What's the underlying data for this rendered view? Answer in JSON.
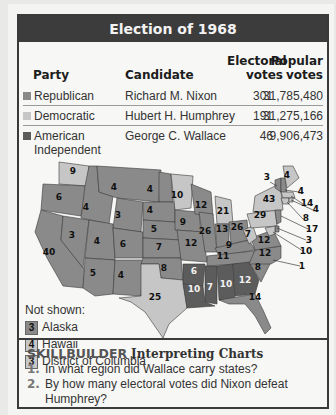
{
  "title": "Election of 1968",
  "table": {
    "headers": {
      "party": "Party",
      "candidate": "Candidate",
      "electoral_line1": "Electoral",
      "electoral_line2": "votes",
      "popular_line1": "Popular",
      "popular_line2": "votes"
    },
    "rows": [
      {
        "party": "Republican",
        "party_line2": "",
        "candidate": "Richard M. Nixon",
        "electoral": "301",
        "popular": "31,785,480",
        "color": "#8a8a8a"
      },
      {
        "party": "Democratic",
        "party_line2": "",
        "candidate": "Hubert H. Humphrey",
        "electoral": "191",
        "popular": "31,275,166",
        "color": "#c6c6c6"
      },
      {
        "party": "American",
        "party_line2": "Independent",
        "candidate": "George C. Wallace",
        "electoral": "46",
        "popular": "9,906,473",
        "color": "#5c5c5c"
      }
    ]
  },
  "not_shown": {
    "label": "Not shown:",
    "items": [
      {
        "votes": "3",
        "state": "Alaska",
        "party": "Republican"
      },
      {
        "votes": "4",
        "state": "Hawaii",
        "party": "Democratic"
      },
      {
        "votes": "3",
        "state": "District of Columbia",
        "party": "Democratic"
      }
    ]
  },
  "skillbuilder": {
    "label": "SKILLBUILDER",
    "subtitle": "Interpreting Charts",
    "questions": [
      {
        "num": "1.",
        "text": "In what region did Wallace carry states?"
      },
      {
        "num": "2.",
        "text": "By how many electoral votes did Nixon defeat Humphrey?"
      }
    ]
  },
  "colors": {
    "republican": "#8a8a8a",
    "democratic": "#c6c6c6",
    "american_independent": "#5c5c5c",
    "header_bg": "#3c3c3c",
    "frame": "#3a3a3a"
  },
  "chart_data": {
    "type": "table",
    "title": "Election of 1968",
    "columns": [
      "Party",
      "Candidate",
      "Electoral votes",
      "Popular votes"
    ],
    "rows": [
      [
        "Republican",
        "Richard M. Nixon",
        301,
        31785480
      ],
      [
        "Democratic",
        "Hubert H. Humphrey",
        191,
        31275166
      ],
      [
        "American Independent",
        "George C. Wallace",
        46,
        9906473
      ]
    ],
    "map": {
      "type": "choropleth",
      "legend": [
        "Republican",
        "Democratic",
        "American Independent"
      ],
      "states": [
        {
          "state": "WA",
          "votes": 9,
          "party": "Democratic"
        },
        {
          "state": "OR",
          "votes": 6,
          "party": "Republican"
        },
        {
          "state": "CA",
          "votes": 40,
          "party": "Republican"
        },
        {
          "state": "ID",
          "votes": 4,
          "party": "Republican"
        },
        {
          "state": "NV",
          "votes": 3,
          "party": "Republican"
        },
        {
          "state": "MT",
          "votes": 4,
          "party": "Republican"
        },
        {
          "state": "WY",
          "votes": 3,
          "party": "Republican"
        },
        {
          "state": "UT",
          "votes": 4,
          "party": "Republican"
        },
        {
          "state": "AZ",
          "votes": 5,
          "party": "Republican"
        },
        {
          "state": "CO",
          "votes": 6,
          "party": "Republican"
        },
        {
          "state": "NM",
          "votes": 4,
          "party": "Republican"
        },
        {
          "state": "ND",
          "votes": 4,
          "party": "Republican"
        },
        {
          "state": "SD",
          "votes": 4,
          "party": "Republican"
        },
        {
          "state": "NE",
          "votes": 5,
          "party": "Republican"
        },
        {
          "state": "KS",
          "votes": 7,
          "party": "Republican"
        },
        {
          "state": "OK",
          "votes": 8,
          "party": "Republican"
        },
        {
          "state": "TX",
          "votes": 25,
          "party": "Democratic"
        },
        {
          "state": "MN",
          "votes": 10,
          "party": "Democratic"
        },
        {
          "state": "IA",
          "votes": 9,
          "party": "Republican"
        },
        {
          "state": "MO",
          "votes": 12,
          "party": "Republican"
        },
        {
          "state": "AR",
          "votes": 6,
          "party": "American Independent"
        },
        {
          "state": "LA",
          "votes": 10,
          "party": "American Independent"
        },
        {
          "state": "WI",
          "votes": 12,
          "party": "Republican"
        },
        {
          "state": "IL",
          "votes": 26,
          "party": "Republican"
        },
        {
          "state": "MI",
          "votes": 21,
          "party": "Democratic"
        },
        {
          "state": "IN",
          "votes": 13,
          "party": "Republican"
        },
        {
          "state": "OH",
          "votes": 26,
          "party": "Republican"
        },
        {
          "state": "KY",
          "votes": 9,
          "party": "Republican"
        },
        {
          "state": "TN",
          "votes": 11,
          "party": "Republican"
        },
        {
          "state": "MS",
          "votes": 7,
          "party": "American Independent"
        },
        {
          "state": "AL",
          "votes": 10,
          "party": "American Independent"
        },
        {
          "state": "GA",
          "votes": 12,
          "party": "American Independent"
        },
        {
          "state": "FL",
          "votes": 14,
          "party": "Republican"
        },
        {
          "state": "SC",
          "votes": 8,
          "party": "Republican"
        },
        {
          "state": "NC",
          "votes": 12,
          "party": "Republican",
          "note": "1 faithless elector for Wallace"
        },
        {
          "state": "VA",
          "votes": 12,
          "party": "Republican"
        },
        {
          "state": "WV",
          "votes": 7,
          "party": "Democratic"
        },
        {
          "state": "PA",
          "votes": 29,
          "party": "Democratic"
        },
        {
          "state": "NY",
          "votes": 43,
          "party": "Democratic"
        },
        {
          "state": "VT",
          "votes": 3,
          "party": "Republican"
        },
        {
          "state": "NH",
          "votes": 4,
          "party": "Republican"
        },
        {
          "state": "ME",
          "votes": 4,
          "party": "Democratic"
        },
        {
          "state": "MA",
          "votes": 14,
          "party": "Democratic"
        },
        {
          "state": "RI",
          "votes": 4,
          "party": "Democratic"
        },
        {
          "state": "CT",
          "votes": 8,
          "party": "Democratic"
        },
        {
          "state": "NJ",
          "votes": 17,
          "party": "Republican"
        },
        {
          "state": "DE",
          "votes": 3,
          "party": "Republican"
        },
        {
          "state": "MD",
          "votes": 10,
          "party": "Democratic"
        },
        {
          "state": "AK",
          "votes": 3,
          "party": "Republican"
        },
        {
          "state": "HI",
          "votes": 4,
          "party": "Democratic"
        },
        {
          "state": "DC",
          "votes": 3,
          "party": "Democratic"
        }
      ],
      "labels": [
        {
          "text": "9",
          "x": 54,
          "y": 34
        },
        {
          "text": "6",
          "x": 40,
          "y": 60
        },
        {
          "text": "4",
          "x": 67,
          "y": 70
        },
        {
          "text": "4",
          "x": 95,
          "y": 50
        },
        {
          "text": "4",
          "x": 131,
          "y": 52
        },
        {
          "text": "4",
          "x": 131,
          "y": 73
        },
        {
          "text": "3",
          "x": 99,
          "y": 78
        },
        {
          "text": "5",
          "x": 135,
          "y": 92
        },
        {
          "text": "3",
          "x": 53,
          "y": 98
        },
        {
          "text": "4",
          "x": 78,
          "y": 104
        },
        {
          "text": "6",
          "x": 104,
          "y": 107
        },
        {
          "text": "7",
          "x": 140,
          "y": 110
        },
        {
          "text": "40",
          "x": 30,
          "y": 115
        },
        {
          "text": "5",
          "x": 74,
          "y": 136
        },
        {
          "text": "4",
          "x": 102,
          "y": 138
        },
        {
          "text": "8",
          "x": 145,
          "y": 131
        },
        {
          "text": "25",
          "x": 136,
          "y": 160
        },
        {
          "text": "10",
          "x": 158,
          "y": 58
        },
        {
          "text": "12",
          "x": 182,
          "y": 68
        },
        {
          "text": "21",
          "x": 204,
          "y": 74
        },
        {
          "text": "9",
          "x": 164,
          "y": 85
        },
        {
          "text": "26",
          "x": 186,
          "y": 94
        },
        {
          "text": "13",
          "x": 203,
          "y": 92
        },
        {
          "text": "26",
          "x": 218,
          "y": 90
        },
        {
          "text": "29",
          "x": 241,
          "y": 78
        },
        {
          "text": "43",
          "x": 250,
          "y": 62
        },
        {
          "text": "12",
          "x": 172,
          "y": 106
        },
        {
          "text": "7",
          "x": 229,
          "y": 97
        },
        {
          "text": "12",
          "x": 245,
          "y": 103
        },
        {
          "text": "9",
          "x": 210,
          "y": 108
        },
        {
          "text": "12",
          "x": 246,
          "y": 116
        },
        {
          "text": "11",
          "x": 204,
          "y": 119
        },
        {
          "text": "8",
          "x": 239,
          "y": 130
        },
        {
          "text": "6",
          "x": 175,
          "y": 134
        },
        {
          "text": "10",
          "x": 175,
          "y": 152
        },
        {
          "text": "7",
          "x": 191,
          "y": 150
        },
        {
          "text": "10",
          "x": 207,
          "y": 147
        },
        {
          "text": "12",
          "x": 226,
          "y": 143
        },
        {
          "text": "14",
          "x": 236,
          "y": 160
        },
        {
          "text": "3",
          "x": 248,
          "y": 40
        },
        {
          "text": "4",
          "x": 268,
          "y": 38
        },
        {
          "text": "4",
          "x": 282,
          "y": 54
        },
        {
          "text": "14",
          "x": 288,
          "y": 66
        },
        {
          "text": "4",
          "x": 297,
          "y": 72
        },
        {
          "text": "8",
          "x": 287,
          "y": 81
        },
        {
          "text": "17",
          "x": 293,
          "y": 92
        },
        {
          "text": "3",
          "x": 290,
          "y": 103
        },
        {
          "text": "10",
          "x": 287,
          "y": 114
        },
        {
          "text": "1",
          "x": 283,
          "y": 129
        }
      ]
    }
  }
}
